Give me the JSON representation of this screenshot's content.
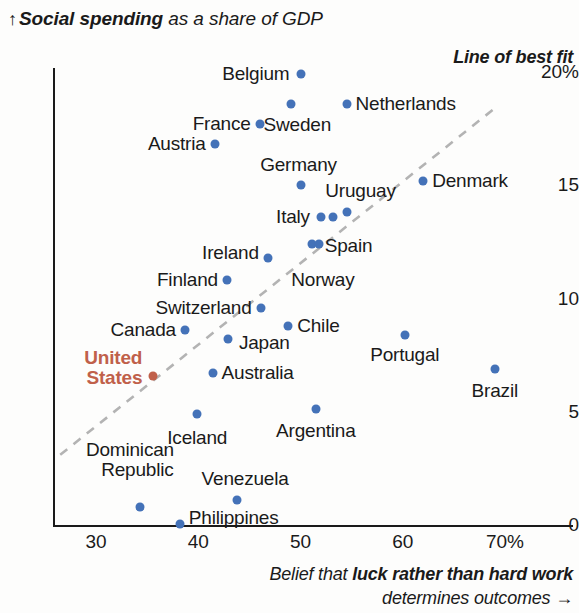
{
  "title": {
    "arrow": "↑",
    "prefix": "",
    "emphasis": "Social spending",
    "suffix": " as a share of GDP"
  },
  "annotation": {
    "best_fit": "Line of best fit"
  },
  "xaxis_caption": {
    "line1_prefix": "Belief that ",
    "line1_emphasis": "luck rather than hard work",
    "line2": "determines outcomes ",
    "arrow": "→"
  },
  "colors": {
    "dot": "#4472b8",
    "highlight": "#c0604a",
    "axis": "#1a1a1a",
    "trendline": "#b3b3b3"
  },
  "chart_data": {
    "type": "scatter",
    "title": "Social spending as a share of GDP",
    "xlabel": "Belief that luck rather than hard work determines outcomes",
    "ylabel": "Social spending as a share of GDP",
    "xlim": [
      26,
      72
    ],
    "ylim": [
      0,
      20.5
    ],
    "grid": false,
    "legend": null,
    "xticks": [
      {
        "value": 30,
        "label": "30"
      },
      {
        "value": 40,
        "label": "40"
      },
      {
        "value": 50,
        "label": "50"
      },
      {
        "value": 60,
        "label": "60"
      },
      {
        "value": 70,
        "label": "70%"
      }
    ],
    "yticks": [
      {
        "value": 20,
        "label": "20%"
      },
      {
        "value": 15,
        "label": "15"
      },
      {
        "value": 10,
        "label": "10"
      },
      {
        "value": 5,
        "label": "5"
      },
      {
        "value": 0,
        "label": "0"
      }
    ],
    "trendline": {
      "label": "Line of best fit",
      "x": [
        26.5,
        69.0
      ],
      "y": [
        3.1,
        18.4
      ],
      "style": "dashed"
    },
    "points": [
      {
        "name": "Belgium",
        "x": 50.0,
        "y": 19.9,
        "label_pos": "left",
        "highlight": false
      },
      {
        "name": "Netherlands",
        "x": 54.5,
        "y": 18.6,
        "label_pos": "right",
        "highlight": false
      },
      {
        "name": "Sweden",
        "x": 49.1,
        "y": 18.6,
        "label_pos": "below",
        "highlight": false
      },
      {
        "name": "France",
        "x": 46.0,
        "y": 17.7,
        "label_pos": "left",
        "highlight": false
      },
      {
        "name": "Austria",
        "x": 41.6,
        "y": 16.8,
        "label_pos": "left",
        "highlight": false
      },
      {
        "name": "Germany",
        "x": 50.0,
        "y": 15.0,
        "label_pos": "above",
        "highlight": false
      },
      {
        "name": "Denmark",
        "x": 62.0,
        "y": 15.2,
        "label_pos": "right",
        "highlight": false
      },
      {
        "name": "Uruguay",
        "x": 54.5,
        "y": 13.8,
        "label_pos": "above",
        "highlight": false
      },
      {
        "name": "Italy",
        "x": 52.0,
        "y": 13.6,
        "label_pos": "left",
        "highlight": false
      },
      {
        "name": "",
        "x": 53.2,
        "y": 13.6,
        "label_pos": "none",
        "highlight": false
      },
      {
        "name": "Spain",
        "x": 51.1,
        "y": 12.4,
        "label_pos": "right",
        "highlight": false
      },
      {
        "name": "Ireland",
        "x": 46.8,
        "y": 11.8,
        "label_pos": "left",
        "highlight": false
      },
      {
        "name": "Norway",
        "x": 51.8,
        "y": 12.4,
        "label_pos": "below",
        "highlight": false
      },
      {
        "name": "Finland",
        "x": 42.8,
        "y": 10.8,
        "label_pos": "left",
        "highlight": false
      },
      {
        "name": "Switzerland",
        "x": 46.1,
        "y": 9.6,
        "label_pos": "left",
        "highlight": false
      },
      {
        "name": "Chile",
        "x": 48.8,
        "y": 8.8,
        "label_pos": "right",
        "highlight": false
      },
      {
        "name": "Canada",
        "x": 38.7,
        "y": 8.6,
        "label_pos": "left",
        "highlight": false
      },
      {
        "name": "Portugal",
        "x": 60.2,
        "y": 8.4,
        "label_pos": "below",
        "highlight": false
      },
      {
        "name": "Japan",
        "x": 42.9,
        "y": 8.2,
        "label_pos": "right",
        "highlight": false
      },
      {
        "name": "Brazil",
        "x": 69.0,
        "y": 6.9,
        "label_pos": "below",
        "highlight": false
      },
      {
        "name": "Australia",
        "x": 41.4,
        "y": 6.7,
        "label_pos": "right",
        "highlight": false
      },
      {
        "name": "United States",
        "x": 35.6,
        "y": 6.6,
        "label_pos": "left",
        "highlight": true
      },
      {
        "name": "Argentina",
        "x": 51.5,
        "y": 5.1,
        "label_pos": "below",
        "highlight": false
      },
      {
        "name": "Iceland",
        "x": 39.9,
        "y": 4.9,
        "label_pos": "below",
        "highlight": false
      },
      {
        "name": "Venezuela",
        "x": 43.8,
        "y": 1.1,
        "label_pos": "above",
        "highlight": false
      },
      {
        "name": "Dominican Republic",
        "x": 34.3,
        "y": 0.8,
        "label_pos": "above",
        "highlight": false
      },
      {
        "name": "Philippines",
        "x": 38.2,
        "y": 0.05,
        "label_pos": "right",
        "highlight": false
      }
    ]
  }
}
